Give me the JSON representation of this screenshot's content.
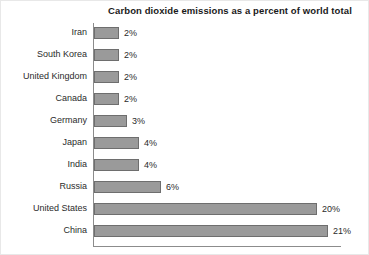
{
  "chart_data": {
    "type": "bar",
    "orientation": "horizontal",
    "title": "Carbon dioxide emissions as a percent of world total",
    "xlabel": "",
    "ylabel": "",
    "xlim": [
      0,
      22
    ],
    "grid": false,
    "legend": false,
    "categories": [
      "Iran",
      "South Korea",
      "United Kingdom",
      "Canada",
      "Germany",
      "Japan",
      "India",
      "Russia",
      "United States",
      "China"
    ],
    "values": [
      2,
      2,
      2,
      2,
      3,
      4,
      4,
      6,
      20,
      21
    ],
    "value_labels": [
      "2%",
      "2%",
      "2%",
      "2%",
      "3%",
      "4%",
      "4%",
      "6%",
      "20%",
      "21%"
    ],
    "units": "percent",
    "bar_color": "#9a9a9a",
    "bar_edge_color": "#6e6e6e",
    "axis_color": "#8c8c8c",
    "text_color": "#2b2b2b"
  }
}
